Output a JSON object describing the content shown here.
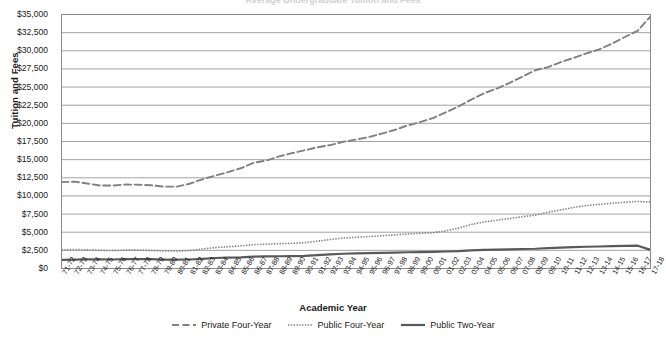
{
  "chart_data": {
    "type": "line",
    "title": "Average Undergraduate Tuition and Fees",
    "xlabel": "Academic Year",
    "ylabel": "Tuition and Fees",
    "ylim": [
      0,
      35000
    ],
    "ytick_step": 2500,
    "ytick_labels": [
      "$35,000",
      "$32,500",
      "$30,000",
      "$27,500",
      "$25,000",
      "$22,500",
      "$20,000",
      "$17,500",
      "$15,000",
      "$12,500",
      "$10,000",
      "$7,500",
      "$5,000",
      "$2,500",
      "$0"
    ],
    "grid": "horizontal",
    "legend_position": "bottom",
    "categories": [
      "71-72",
      "72-73",
      "73-74",
      "74-75",
      "75-76",
      "76-77",
      "77-78",
      "78-79",
      "79-80",
      "80-81",
      "81-82",
      "82-83",
      "83-84",
      "84-85",
      "85-86",
      "86-87",
      "87-88",
      "88-89",
      "89-90",
      "90-91",
      "91-92",
      "92-93",
      "93-94",
      "94-95",
      "95-96",
      "96-97",
      "97-98",
      "98-99",
      "99-00",
      "00-01",
      "01-02",
      "02-03",
      "03-04",
      "04-05",
      "05-06",
      "06-07",
      "07-08",
      "08-09",
      "09-10",
      "10-11",
      "11-12",
      "12-13",
      "13-14",
      "14-15",
      "15-16",
      "16-17",
      "17-18"
    ],
    "series": [
      {
        "name": "Private Four-Year",
        "style": "dashed",
        "color": "#808080",
        "values": [
          11900,
          11970,
          11720,
          11430,
          11430,
          11570,
          11550,
          11470,
          11290,
          11280,
          11680,
          12290,
          12800,
          13270,
          13810,
          14560,
          14880,
          15440,
          15890,
          16300,
          16700,
          17010,
          17460,
          17760,
          18120,
          18580,
          19080,
          19690,
          20170,
          20720,
          21520,
          22320,
          23270,
          24150,
          24800,
          25580,
          26430,
          27320,
          27750,
          28450,
          29020,
          29640,
          30190,
          30990,
          31900,
          32750,
          34740
        ]
      },
      {
        "name": "Public Four-Year",
        "style": "dotted",
        "color": "#808080",
        "values": [
          2580,
          2620,
          2560,
          2500,
          2480,
          2530,
          2530,
          2490,
          2420,
          2400,
          2480,
          2690,
          2880,
          3000,
          3120,
          3290,
          3340,
          3420,
          3470,
          3560,
          3760,
          4000,
          4200,
          4300,
          4400,
          4510,
          4630,
          4760,
          4840,
          4930,
          5180,
          5560,
          6070,
          6420,
          6650,
          6890,
          7130,
          7350,
          7750,
          8070,
          8420,
          8680,
          8840,
          8990,
          9130,
          9240,
          9140
        ]
      },
      {
        "name": "Public Two-Year",
        "style": "solid",
        "color": "#595959",
        "values": [
          1190,
          1230,
          1250,
          1250,
          1240,
          1290,
          1300,
          1280,
          1230,
          1210,
          1240,
          1330,
          1450,
          1500,
          1540,
          1630,
          1670,
          1690,
          1710,
          1750,
          1850,
          1940,
          2030,
          2080,
          2120,
          2160,
          2200,
          2240,
          2260,
          2290,
          2340,
          2400,
          2510,
          2560,
          2600,
          2640,
          2690,
          2720,
          2810,
          2870,
          2950,
          3000,
          3030,
          3070,
          3110,
          3140,
          2570
        ]
      }
    ]
  },
  "legend": {
    "items": [
      {
        "label": "Private Four-Year"
      },
      {
        "label": "Public Four-Year"
      },
      {
        "label": "Public Two-Year"
      }
    ]
  }
}
